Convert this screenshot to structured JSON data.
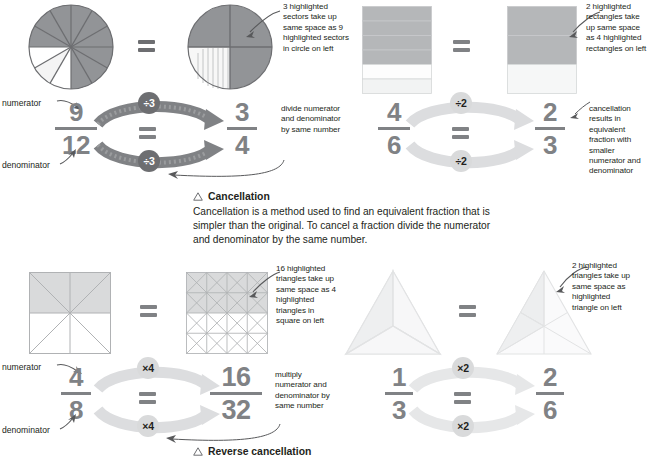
{
  "colors": {
    "shade_strong": "#929497",
    "shade_mid": "#b5b7b9",
    "shade_light": "#d9dadb",
    "shade_faint": "#eceded",
    "numeral": "#808285",
    "badge_dark": "#6d6e71",
    "badge_light": "#d9dadb",
    "arrow_dark": "#808285",
    "arrow_light": "#dcdddf",
    "text": "#231f20",
    "line": "#6d6e71",
    "line_light": "#bcbec0"
  },
  "panels": {
    "circles": {
      "name": "circle-sectors-example",
      "left_shape": {
        "type": "circle",
        "sectors": 12,
        "highlighted": 9
      },
      "right_shape": {
        "type": "circle",
        "sectors": 4,
        "highlighted": 3
      },
      "annotation": "3 highlighted sectors take up same space as 9 highlighted sectors in circle on left",
      "equals": "=",
      "fraction_left": {
        "numerator": "9",
        "denominator": "12"
      },
      "fraction_right": {
        "numerator": "3",
        "denominator": "4"
      },
      "op_top": "÷3",
      "op_bottom": "÷3",
      "label_numerator": "numerator",
      "label_denominator": "denominator",
      "side_note": "divide numerator and denominator by same number"
    },
    "rectangles": {
      "name": "rectangle-bars-example",
      "left_shape": {
        "type": "bars",
        "parts": 6,
        "highlighted": 4
      },
      "right_shape": {
        "type": "bars",
        "parts": 3,
        "highlighted": 2
      },
      "annotation": "2 highlighted rectangles take up same space as 4 highlighted rectangles on left",
      "equals": "=",
      "fraction_left": {
        "numerator": "4",
        "denominator": "6"
      },
      "fraction_right": {
        "numerator": "2",
        "denominator": "3"
      },
      "op_top": "÷2",
      "op_bottom": "÷2",
      "side_note": "cancellation results in equivalent fraction with smaller numerator and denominator"
    },
    "squares": {
      "name": "square-triangles-example",
      "left_shape": {
        "type": "square-triangles",
        "parts": 8,
        "highlighted": 4
      },
      "right_shape": {
        "type": "square-triangles",
        "parts": 32,
        "highlighted": 16
      },
      "annotation": "16 highlighted triangles take up same space as 4 highlighted triangles in square on left",
      "equals": "=",
      "fraction_left": {
        "numerator": "4",
        "denominator": "8"
      },
      "fraction_right": {
        "numerator": "16",
        "denominator": "32"
      },
      "op_top": "×4",
      "op_bottom": "×4",
      "label_numerator": "numerator",
      "label_denominator": "denominator",
      "side_note": "multiply numerator and denominator by same number"
    },
    "triangles": {
      "name": "triangle-parts-example",
      "left_shape": {
        "type": "triangle",
        "parts": 3,
        "highlighted": 1
      },
      "right_shape": {
        "type": "triangle",
        "parts": 6,
        "highlighted": 2
      },
      "annotation": "2 highlighted triangles take up same space as highlighted triangle on left",
      "equals": "=",
      "fraction_left": {
        "numerator": "1",
        "denominator": "3"
      },
      "fraction_right": {
        "numerator": "2",
        "denominator": "6"
      },
      "op_top": "×2",
      "op_bottom": "×2"
    }
  },
  "sections": {
    "cancellation": {
      "title": "Cancellation",
      "body": "Cancellation is a method used to find an equivalent fraction that is simpler than the original. To cancel a fraction divide the numerator and denominator by the same number."
    },
    "reverse_cancellation": {
      "title": "Reverse cancellation"
    }
  }
}
